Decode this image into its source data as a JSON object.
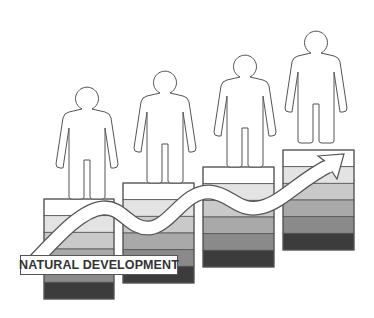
{
  "diagram": {
    "label": "NATURAL DEVELOPMENT",
    "band_colors": [
      "#ffffff",
      "#e3e3e3",
      "#c9c9c9",
      "#a9a9a9",
      "#8a8a8a",
      "#3c3c3c"
    ],
    "outline_color": "#555555",
    "steps": [
      {
        "index": 1,
        "x": 44,
        "y": 199,
        "w": 70,
        "h": 100
      },
      {
        "index": 2,
        "x": 123,
        "y": 183,
        "w": 71,
        "h": 100
      },
      {
        "index": 3,
        "x": 203,
        "y": 167,
        "w": 71,
        "h": 100
      },
      {
        "index": 4,
        "x": 283,
        "y": 150,
        "w": 71,
        "h": 100
      }
    ],
    "people": [
      {
        "index": 1,
        "cx": 87,
        "feet_y": 199
      },
      {
        "index": 2,
        "cx": 165,
        "feet_y": 183
      },
      {
        "index": 3,
        "cx": 245,
        "feet_y": 167
      },
      {
        "index": 4,
        "cx": 316,
        "feet_y": 143
      }
    ]
  }
}
